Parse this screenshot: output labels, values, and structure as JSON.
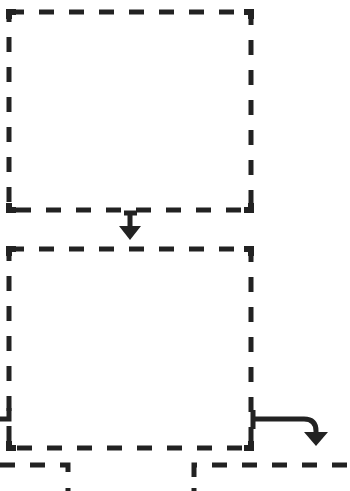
{
  "diagram": {
    "type": "flowchart-fragment",
    "stroke_color": "#222222",
    "background": "#ffffff",
    "boxes": [
      {
        "id": "box-1",
        "style": "dashed",
        "label": ""
      },
      {
        "id": "box-2",
        "style": "dashed",
        "label": ""
      },
      {
        "id": "box-3-partial",
        "style": "dashed",
        "label": ""
      },
      {
        "id": "box-4-partial",
        "style": "dashed",
        "label": ""
      }
    ],
    "arrows": [
      {
        "from": "box-1",
        "to": "box-2",
        "direction": "down"
      },
      {
        "from": "box-2",
        "to": "box-4-partial",
        "direction": "right-then-down"
      },
      {
        "from": "box-2",
        "to": "box-3-partial",
        "direction": "left-bracket"
      }
    ]
  }
}
